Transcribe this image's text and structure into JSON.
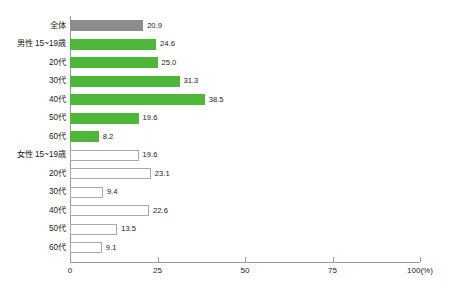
{
  "chart_data": {
    "type": "bar",
    "orientation": "horizontal",
    "title": "",
    "xlabel": "",
    "ylabel": "",
    "xlim": [
      0,
      100
    ],
    "xticks": [
      0,
      25,
      50,
      75,
      100
    ],
    "xtick_labels": [
      "0",
      "25",
      "50",
      "75",
      "100(%)"
    ],
    "unit_label": "(%)",
    "grid": false,
    "legend": "none",
    "categories": [
      "全体",
      "男性 15~19歳",
      "20代",
      "30代",
      "40代",
      "50代",
      "60代",
      "女性 15~19歳",
      "20代",
      "30代",
      "40代",
      "50代",
      "60代"
    ],
    "values": [
      20.9,
      24.6,
      25.0,
      31.3,
      38.5,
      19.6,
      8.2,
      19.6,
      23.1,
      9.4,
      22.6,
      13.5,
      9.1
    ],
    "value_labels": [
      "20.9",
      "24.6",
      "25.0",
      "31.3",
      "38.5",
      "19.6",
      "8.2",
      "19.6",
      "23.1",
      "9.4",
      "22.6",
      "13.5",
      "9.1"
    ],
    "groups": [
      "total",
      "male",
      "male",
      "male",
      "male",
      "male",
      "male",
      "female",
      "female",
      "female",
      "female",
      "female",
      "female"
    ],
    "colors": {
      "total": "#8c8c8c",
      "male": "#4fb63a",
      "female": "#ffffff",
      "female_border": "#a9a9a9",
      "axis": "#9a9a9a",
      "text": "#1a1a1a"
    }
  },
  "axis": {
    "ticks": [
      {
        "value": 0,
        "label": "0"
      },
      {
        "value": 25,
        "label": "25"
      },
      {
        "value": 50,
        "label": "50"
      },
      {
        "value": 75,
        "label": "75"
      },
      {
        "value": 100,
        "label": "100(%)"
      }
    ]
  }
}
